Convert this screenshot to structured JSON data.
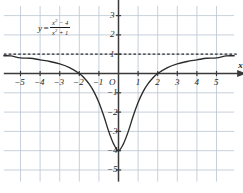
{
  "chart_data": {
    "type": "line",
    "title": "",
    "equation_label": {
      "lhs": "y",
      "equals": "=",
      "numerator_base": "x",
      "numerator_exp": "2",
      "numerator_rest": " − 4",
      "denominator_base": "x",
      "denominator_exp": "2",
      "denominator_rest": " + 1",
      "plain": "y = (x^2 - 4)/(x^2 + 1)"
    },
    "function": "(x^2 - 4)/(x^2 + 1)",
    "xlabel": "x",
    "ylabel": "y",
    "origin_label": "O",
    "xlim": [
      -5.85,
      5.9
    ],
    "ylim": [
      -5.6,
      3.5
    ],
    "xticks": [
      -5,
      -4,
      -3,
      -2,
      -1,
      1,
      2,
      3,
      4,
      5
    ],
    "yticks": [
      3,
      2,
      1,
      -1,
      -2,
      -3,
      -4,
      -5
    ],
    "xtick_labels": [
      "−5",
      "−4",
      "−3",
      "−2",
      "−1",
      "1",
      "2",
      "3",
      "4",
      "5"
    ],
    "ytick_labels": [
      "3",
      "2",
      "1",
      "−1",
      "−2",
      "−3",
      "−4",
      "−5"
    ],
    "grid": true,
    "legend": "none",
    "asymptote": {
      "type": "horizontal",
      "y": 1,
      "style": "dashed"
    },
    "x_intercepts": [
      -2,
      2
    ],
    "y_intercept": -4,
    "minimum": {
      "x": 0,
      "y": -4
    },
    "curve_points": [
      {
        "x": -5.85,
        "y": 0.919
      },
      {
        "x": -5.5,
        "y": 0.911
      },
      {
        "x": -5.0,
        "y": 0.808
      },
      {
        "x": -4.5,
        "y": 0.791
      },
      {
        "x": -4.0,
        "y": 0.706
      },
      {
        "x": -3.5,
        "y": 0.623
      },
      {
        "x": -3.0,
        "y": 0.5
      },
      {
        "x": -2.5,
        "y": 0.31
      },
      {
        "x": -2.0,
        "y": 0.0
      },
      {
        "x": -1.75,
        "y": -0.23
      },
      {
        "x": -1.5,
        "y": -0.538
      },
      {
        "x": -1.25,
        "y": -0.951
      },
      {
        "x": -1.0,
        "y": -1.5
      },
      {
        "x": -0.75,
        "y": -2.2
      },
      {
        "x": -0.5,
        "y": -3.0
      },
      {
        "x": -0.25,
        "y": -3.647
      },
      {
        "x": 0.0,
        "y": -4.0
      },
      {
        "x": 0.25,
        "y": -3.647
      },
      {
        "x": 0.5,
        "y": -3.0
      },
      {
        "x": 0.75,
        "y": -2.2
      },
      {
        "x": 1.0,
        "y": -1.5
      },
      {
        "x": 1.25,
        "y": -0.951
      },
      {
        "x": 1.5,
        "y": -0.538
      },
      {
        "x": 1.75,
        "y": -0.23
      },
      {
        "x": 2.0,
        "y": 0.0
      },
      {
        "x": 2.5,
        "y": 0.31
      },
      {
        "x": 3.0,
        "y": 0.5
      },
      {
        "x": 3.5,
        "y": 0.623
      },
      {
        "x": 4.0,
        "y": 0.706
      },
      {
        "x": 4.5,
        "y": 0.791
      },
      {
        "x": 5.0,
        "y": 0.808
      },
      {
        "x": 5.5,
        "y": 0.911
      },
      {
        "x": 5.9,
        "y": 0.919
      }
    ],
    "colors": {
      "curve": "#2b2b2b",
      "axis": "#3a3a3a",
      "grid": "#b9c4d2",
      "asymptote": "#2b2b2b",
      "text": "#1c1c1c",
      "background": "#ffffff"
    }
  }
}
